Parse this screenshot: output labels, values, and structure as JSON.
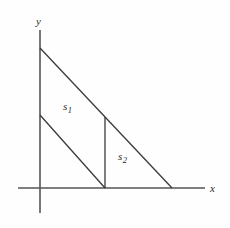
{
  "figure": {
    "title": "",
    "background_color": "#fefefe",
    "axis_color": "#555555",
    "line_color": "#3a3a3a",
    "width": 230,
    "height": 228
  },
  "axes": {
    "x_label": "x",
    "y_label": "y",
    "x_axis": {
      "x1": 18,
      "y1": 188,
      "x2": 205,
      "y2": 188
    },
    "y_axis": {
      "x1": 40,
      "y1": 30,
      "x2": 40,
      "y2": 213
    },
    "origin": {
      "x": 40,
      "y": 188
    }
  },
  "regions": [
    {
      "name": "s1",
      "label": "s",
      "subscript": "1",
      "description": "upper-left parallelogram-like region between the two parallel slanted lines, the y-axis and the vertical divider"
    },
    {
      "name": "s2",
      "label": "s",
      "subscript": "2",
      "description": "lower-right triangular region bounded by the vertical divider, the x-axis and the hypotenuse"
    }
  ],
  "lines": [
    {
      "name": "hypotenuse",
      "from": {
        "x": 40,
        "y": 48
      },
      "to": {
        "x": 172,
        "y": 188
      }
    },
    {
      "name": "inner-parallel-line",
      "from": {
        "x": 40,
        "y": 115
      },
      "to": {
        "x": 105,
        "y": 188
      }
    },
    {
      "name": "vertical-divider",
      "from": {
        "x": 105,
        "y": 117
      },
      "to": {
        "x": 105,
        "y": 188
      }
    }
  ]
}
